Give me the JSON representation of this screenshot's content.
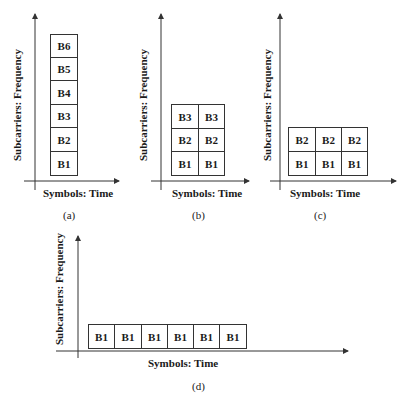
{
  "panels": [
    {
      "id": "a",
      "caption": "(a)",
      "y_axis_label": "Subcarriers: Frequency",
      "x_axis_label": "Symbols: Time",
      "grid": {
        "rows": 6,
        "cols": 1
      },
      "cells": [
        [
          "B6"
        ],
        [
          "B5"
        ],
        [
          "B4"
        ],
        [
          "B3"
        ],
        [
          "B2"
        ],
        [
          "B1"
        ]
      ]
    },
    {
      "id": "b",
      "caption": "(b)",
      "y_axis_label": "Subcarriers: Frequency",
      "x_axis_label": "Symbols: Time",
      "grid": {
        "rows": 3,
        "cols": 2
      },
      "cells": [
        [
          "B3",
          "B3"
        ],
        [
          "B2",
          "B2"
        ],
        [
          "B1",
          "B1"
        ]
      ]
    },
    {
      "id": "c",
      "caption": "(c)",
      "y_axis_label": "Subcarriers: Frequency",
      "x_axis_label": "Symbols: Time",
      "grid": {
        "rows": 2,
        "cols": 3
      },
      "cells": [
        [
          "B2",
          "B2",
          "B2"
        ],
        [
          "B1",
          "B1",
          "B1"
        ]
      ]
    },
    {
      "id": "d",
      "caption": "(d)",
      "y_axis_label": "Subcarriers: Frequency",
      "x_axis_label": "Symbols: Time",
      "grid": {
        "rows": 1,
        "cols": 6
      },
      "cells": [
        [
          "B1",
          "B1",
          "B1",
          "B1",
          "B1",
          "B1"
        ]
      ]
    }
  ],
  "colors": {
    "line": "#333333",
    "text": "#1a1a1a",
    "background": "#ffffff"
  }
}
